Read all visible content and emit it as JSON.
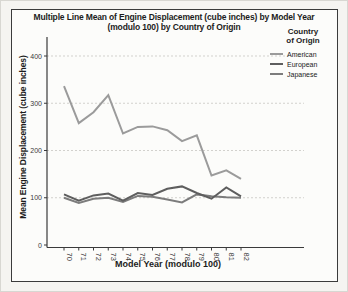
{
  "chart_data": {
    "type": "line",
    "title_line1": "Multiple Line Mean of Engine Displacement (cube inches) by Model Year",
    "title_line2": "(modulo 100) by Country of Origin",
    "xlabel": "Model Year (modulo 100)",
    "ylabel": "Mean Engine Displacement (cube inches)",
    "ylim": [
      0,
      400
    ],
    "yticks": [
      0,
      100,
      200,
      300,
      400
    ],
    "grid": "horizontal dotted gridlines at 100,200,300,400",
    "legend_title_line1": "Country",
    "legend_title_line2": "of Origin",
    "legend_position": "top-right",
    "categories": [
      "70",
      "71",
      "72",
      "73",
      "74",
      "75",
      "76",
      "77",
      "78",
      "79",
      "80",
      "81",
      "82"
    ],
    "series": [
      {
        "name": "American",
        "color": "#9b9b9b",
        "values": [
          336,
          258,
          281,
          317,
          236,
          250,
          251,
          243,
          220,
          232,
          147,
          158,
          140
        ]
      },
      {
        "name": "European",
        "color": "#5e5e5e",
        "values": [
          107,
          94,
          105,
          109,
          94,
          110,
          106,
          119,
          124,
          110,
          98,
          122,
          103
        ]
      },
      {
        "name": "Japanese",
        "color": "#7c7c7c",
        "values": [
          100,
          89,
          98,
          100,
          91,
          104,
          102,
          96,
          90,
          107,
          103,
          101,
          100
        ]
      }
    ],
    "colors": {
      "frame_border": "#3b3b3b",
      "axis": "#3a3a3a",
      "gridline": "#d2d1cd",
      "tick_text": "#3a3a3a"
    }
  }
}
